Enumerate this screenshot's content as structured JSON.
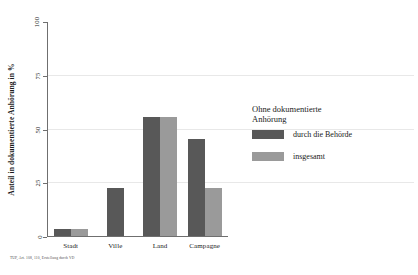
{
  "chart_data": {
    "type": "bar",
    "title": "",
    "subtitle": "",
    "xlabel": "",
    "ylabel": "Anteil in dokumentierte Anhörung in %",
    "ylim": [
      0,
      100
    ],
    "yticks": [
      0,
      25,
      50,
      75,
      100
    ],
    "ytick_labels": [
      "0",
      "25",
      "50",
      "75",
      "100"
    ],
    "grid": "horizontal",
    "grid_values": [
      25,
      50,
      75
    ],
    "legend_position": "right",
    "legend_title": "Ohne dokumentierte\nAnhörung",
    "categories": [
      "Stadt",
      "Ville",
      "Land",
      "Campagne"
    ],
    "series": [
      {
        "name": "durch die Behörde",
        "color": "#585858",
        "values": [
          3,
          22,
          55,
          45
        ]
      },
      {
        "name": "insgesamt",
        "color": "#9a9a9a",
        "values": [
          3,
          0,
          55,
          22
        ]
      }
    ],
    "annotations": {
      "footnote": "TUP, Art. 108, 110, Erstellung durch VD"
    }
  },
  "axis": {
    "colors": {
      "axis_line": "#6f6f6f",
      "gridline": "#e8e8e8",
      "text": "#1a1a1a"
    }
  }
}
